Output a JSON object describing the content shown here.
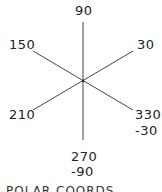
{
  "diagram": {
    "type": "polar-angle-reference",
    "center": [
      83,
      81
    ],
    "line_color": "#444444",
    "axes": [
      {
        "angle": 90,
        "label": "90"
      },
      {
        "angle": 30,
        "label": "30"
      },
      {
        "angle": 150,
        "label": "150"
      },
      {
        "angle": 210,
        "label": "210"
      },
      {
        "angle": 270,
        "label": "270",
        "alt_label": "-90"
      },
      {
        "angle": 330,
        "label": "330",
        "alt_label": "-30"
      }
    ],
    "footer": "POLAR COORDS"
  }
}
